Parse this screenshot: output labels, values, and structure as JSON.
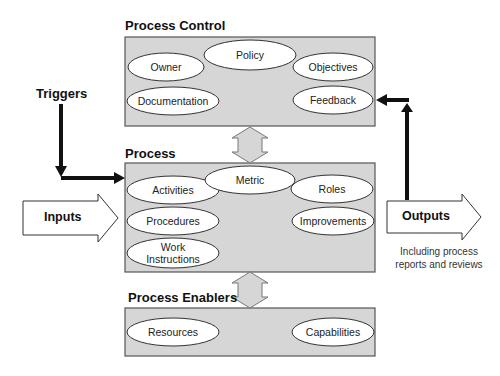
{
  "diagram": {
    "sections": {
      "control": {
        "title": "Process Control",
        "elements": [
          "Policy",
          "Owner",
          "Objectives",
          "Documentation",
          "Feedback"
        ]
      },
      "process": {
        "title": "Process",
        "elements": [
          "Metric",
          "Activities",
          "Roles",
          "Procedures",
          "Improvements",
          "Work Instructions"
        ]
      },
      "enablers": {
        "title": "Process Enablers",
        "elements": [
          "Resources",
          "Capabilities"
        ]
      }
    },
    "external": {
      "triggers": "Triggers",
      "inputs": "Inputs",
      "outputs": "Outputs",
      "outputs_note_line1": "Including process",
      "outputs_note_line2": "reports and reviews"
    },
    "colors": {
      "box_fill": "#d6d6d6",
      "box_stroke": "#555555",
      "ellipse_fill": "#ffffff",
      "arrow_black": "#111111"
    }
  }
}
